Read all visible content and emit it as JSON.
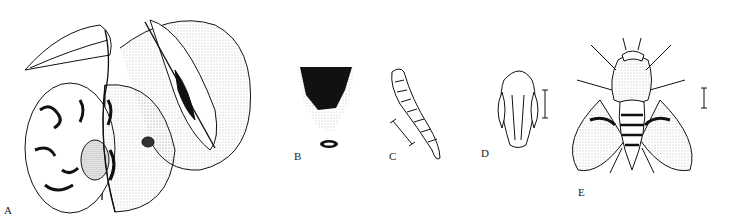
{
  "figure": {
    "panels": [
      {
        "id": "A",
        "label": "A",
        "subject": "apple-with-tunnels-and-fly"
      },
      {
        "id": "B",
        "label": "B",
        "subject": "tunnel-section"
      },
      {
        "id": "C",
        "label": "C",
        "subject": "larva"
      },
      {
        "id": "D",
        "label": "D",
        "subject": "pupa"
      },
      {
        "id": "E",
        "label": "E",
        "subject": "adult-fly"
      }
    ]
  }
}
